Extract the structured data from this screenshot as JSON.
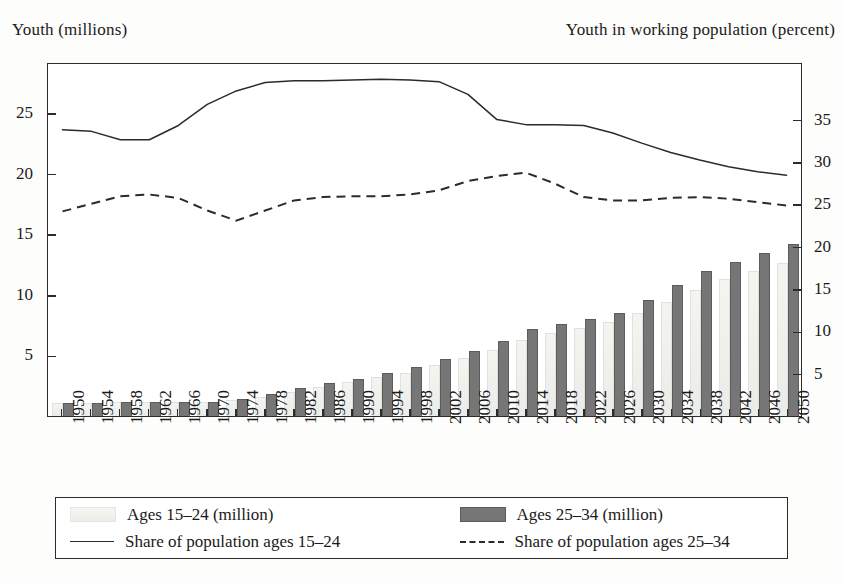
{
  "chart_data": {
    "type": "bar",
    "title": "",
    "ylabel": "Youth (millions)",
    "y2label": "Youth in working population (percent)",
    "xlabel": "",
    "grid": false,
    "legend_position": "bottom",
    "ylim": [
      0,
      29.2
    ],
    "y2lim": [
      0,
      41.8
    ],
    "yticks": [
      5,
      10,
      15,
      20,
      25
    ],
    "y2ticks": [
      5,
      10,
      15,
      20,
      25,
      30,
      35
    ],
    "categories": [
      "1950",
      "1954",
      "1958",
      "1962",
      "1966",
      "1970",
      "1974",
      "1978",
      "1982",
      "1986",
      "1990",
      "1994",
      "1998",
      "2002",
      "2006",
      "2010",
      "2014",
      "2018",
      "2022",
      "2026",
      "2030",
      "2034",
      "2038",
      "2042",
      "2046",
      "2050"
    ],
    "series": [
      {
        "name": "Ages 15–24 (million)",
        "kind": "bar",
        "color": "#efefec",
        "axis": "left",
        "values": [
          1.0,
          1.0,
          1.1,
          1.1,
          1.1,
          1.1,
          1.2,
          1.5,
          1.9,
          2.3,
          2.7,
          3.1,
          3.5,
          4.1,
          4.7,
          5.4,
          6.2,
          6.8,
          7.2,
          7.7,
          8.4,
          9.3,
          10.3,
          11.2,
          11.9,
          12.5
        ]
      },
      {
        "name": "Ages 25–34 (million)",
        "kind": "bar",
        "color": "#767676",
        "axis": "left",
        "values": [
          1.0,
          1.0,
          1.1,
          1.1,
          1.1,
          1.1,
          1.3,
          1.7,
          2.2,
          2.6,
          3.0,
          3.5,
          4.0,
          4.6,
          5.3,
          6.1,
          7.1,
          7.5,
          7.9,
          8.4,
          9.5,
          10.7,
          11.9,
          12.6,
          13.4,
          14.1
        ]
      },
      {
        "name": "Share of population ages 15–24",
        "kind": "line",
        "style": "solid",
        "color": "#2b2b2b",
        "axis": "right",
        "values": [
          34.0,
          33.8,
          32.8,
          32.8,
          34.5,
          37.0,
          38.6,
          39.6,
          39.8,
          39.8,
          39.9,
          40.0,
          39.9,
          39.7,
          38.2,
          35.2,
          34.6,
          34.6,
          34.5,
          33.6,
          32.4,
          31.3,
          30.4,
          29.6,
          29.0,
          28.6
        ]
      },
      {
        "name": "Share of population ages 25–34",
        "kind": "line",
        "style": "dashed",
        "color": "#2b2b2b",
        "axis": "right",
        "values": [
          24.3,
          25.2,
          26.1,
          26.3,
          25.9,
          24.4,
          23.2,
          24.4,
          25.6,
          26.0,
          26.1,
          26.1,
          26.3,
          26.8,
          27.9,
          28.5,
          28.9,
          27.6,
          26.0,
          25.6,
          25.6,
          25.9,
          26.0,
          25.8,
          25.4,
          25.0
        ]
      }
    ]
  },
  "legend": {
    "items": [
      {
        "label": "Ages 15–24 (million)",
        "marker": "light-swatch"
      },
      {
        "label": "Ages 25–34 (million)",
        "marker": "dark-swatch"
      },
      {
        "label": "Share of population ages 15–24",
        "marker": "solid-line"
      },
      {
        "label": "Share of population ages 25–34",
        "marker": "dashed-line"
      }
    ]
  }
}
